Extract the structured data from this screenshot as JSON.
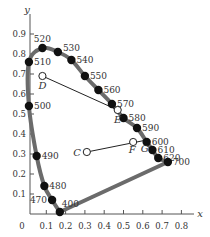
{
  "chart_data": {
    "type": "scatter",
    "xlabel": "x",
    "ylabel": "y",
    "xlim": [
      0,
      0.8
    ],
    "ylim": [
      0,
      0.9
    ],
    "x_ticks": [
      "0.1",
      "0.2",
      "0.3",
      "0.4",
      "0.5",
      "0.6",
      "0.7",
      "0.8"
    ],
    "y_ticks": [
      "0.1",
      "0.2",
      "0.3",
      "0.4",
      "0.5",
      "0.6",
      "0.7",
      "0.8",
      "0.9"
    ],
    "origin_label": "0",
    "grid": false,
    "legend": null,
    "spectral_locus": {
      "name": "spectral locus",
      "color": "#6b6b6b",
      "points": [
        {
          "label": "400",
          "x": 0.17,
          "y": 0.01
        },
        {
          "label": "470",
          "x": 0.13,
          "y": 0.07
        },
        {
          "label": "480",
          "x": 0.09,
          "y": 0.14
        },
        {
          "label": "490",
          "x": 0.05,
          "y": 0.29
        },
        {
          "label": "500",
          "x": 0.01,
          "y": 0.54
        },
        {
          "label": "510",
          "x": 0.01,
          "y": 0.76
        },
        {
          "label": "520",
          "x": 0.08,
          "y": 0.83
        },
        {
          "label": "530",
          "x": 0.16,
          "y": 0.81
        },
        {
          "label": "540",
          "x": 0.23,
          "y": 0.77
        },
        {
          "label": "550",
          "x": 0.3,
          "y": 0.69
        },
        {
          "label": "560",
          "x": 0.37,
          "y": 0.62
        },
        {
          "label": "570",
          "x": 0.44,
          "y": 0.55
        },
        {
          "label": "580",
          "x": 0.5,
          "y": 0.48
        },
        {
          "label": "590",
          "x": 0.57,
          "y": 0.43
        },
        {
          "label": "600",
          "x": 0.62,
          "y": 0.36
        },
        {
          "label": "610",
          "x": 0.65,
          "y": 0.32
        },
        {
          "label": "620",
          "x": 0.68,
          "y": 0.28
        },
        {
          "label": "700",
          "x": 0.73,
          "y": 0.26
        }
      ]
    },
    "line_of_purples": {
      "from": "400",
      "to": "700"
    },
    "annotated_points": [
      {
        "label": "D",
        "x": 0.08,
        "y": 0.69,
        "style": "open"
      },
      {
        "label": "E",
        "x": 0.47,
        "y": 0.52,
        "style": "open"
      },
      {
        "label": "C",
        "x": 0.31,
        "y": 0.31,
        "style": "open"
      },
      {
        "label": "F",
        "x": 0.55,
        "y": 0.36,
        "style": "open"
      },
      {
        "label": "G",
        "x": 0.62,
        "y": 0.37,
        "style": "on-locus"
      }
    ],
    "segments": [
      {
        "from": "D",
        "to": "E"
      },
      {
        "from": "C",
        "to": "G"
      }
    ]
  },
  "axes": {
    "x_label": "x",
    "y_label": "y",
    "origin": "0"
  }
}
